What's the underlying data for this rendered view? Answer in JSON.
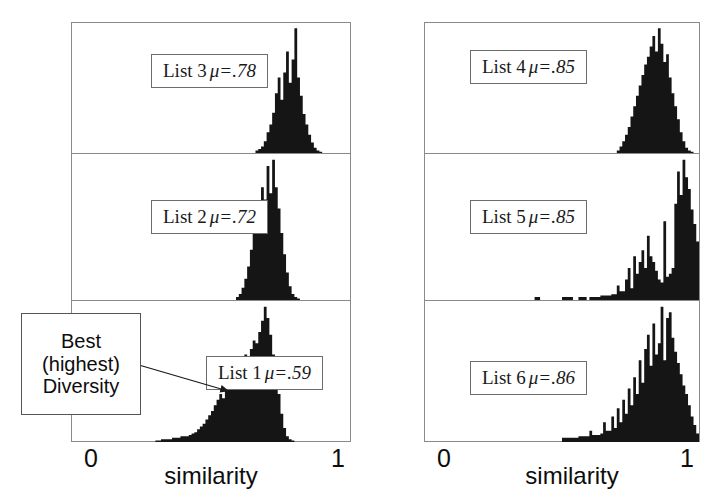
{
  "figure": {
    "title": "",
    "axis": {
      "xlabel": "similarity",
      "tick_min": "0",
      "tick_max": "1"
    },
    "callout": {
      "line1": "Best",
      "line2": "(highest)",
      "line3": "Diversity",
      "target": "List 1 histogram"
    },
    "panels": [
      {
        "id": "list3",
        "label_list": "List 3",
        "label_mu": "μ=.78"
      },
      {
        "id": "list2",
        "label_list": "List 2",
        "label_mu": "μ=.72"
      },
      {
        "id": "list1",
        "label_list": "List 1",
        "label_mu": "μ=.59"
      },
      {
        "id": "list4",
        "label_list": "List 4",
        "label_mu": "μ=.85"
      },
      {
        "id": "list5",
        "label_list": "List 5",
        "label_mu": "μ=.85"
      },
      {
        "id": "list6",
        "label_list": "List 6",
        "label_mu": "μ=.86"
      }
    ]
  },
  "chart_data": {
    "type": "bar",
    "xlabel": "similarity",
    "ylabel": "frequency",
    "xlim": [
      0,
      1
    ],
    "grid": false,
    "legend": "none",
    "layout": "2 columns x 3 stacked histogram panels",
    "bin_width": 0.01,
    "bin_centers": [
      0.005,
      0.015,
      0.025,
      0.035,
      0.045,
      0.055,
      0.065,
      0.075,
      0.085,
      0.095,
      0.105,
      0.115,
      0.125,
      0.135,
      0.145,
      0.155,
      0.165,
      0.175,
      0.185,
      0.195,
      0.205,
      0.215,
      0.225,
      0.235,
      0.245,
      0.255,
      0.265,
      0.275,
      0.285,
      0.295,
      0.305,
      0.315,
      0.325,
      0.335,
      0.345,
      0.355,
      0.365,
      0.375,
      0.385,
      0.395,
      0.405,
      0.415,
      0.425,
      0.435,
      0.445,
      0.455,
      0.465,
      0.475,
      0.485,
      0.495,
      0.505,
      0.515,
      0.525,
      0.535,
      0.545,
      0.555,
      0.565,
      0.575,
      0.585,
      0.595,
      0.605,
      0.615,
      0.625,
      0.635,
      0.645,
      0.655,
      0.665,
      0.675,
      0.685,
      0.695,
      0.705,
      0.715,
      0.725,
      0.735,
      0.745,
      0.755,
      0.765,
      0.775,
      0.785,
      0.795,
      0.805,
      0.815,
      0.825,
      0.835,
      0.845,
      0.855,
      0.865,
      0.875,
      0.885,
      0.895,
      0.905,
      0.915,
      0.925,
      0.935,
      0.945,
      0.955,
      0.965,
      0.975,
      0.985,
      0.995
    ],
    "panels": [
      {
        "name": "List 3",
        "mu": 0.78,
        "position": "left-column, top",
        "ymax": 100,
        "values": [
          0,
          0,
          0,
          0,
          0,
          0,
          0,
          0,
          0,
          0,
          0,
          0,
          0,
          0,
          0,
          0,
          0,
          0,
          0,
          0,
          0,
          0,
          0,
          0,
          0,
          0,
          0,
          0,
          0,
          0,
          0,
          0,
          0,
          0,
          0,
          0,
          0,
          0,
          0,
          0,
          0,
          0,
          0,
          0,
          0,
          0,
          0,
          0,
          0,
          0,
          0,
          0,
          0,
          0,
          0,
          0,
          0,
          0,
          0,
          0,
          0,
          0,
          0,
          0,
          0,
          0,
          2,
          3,
          5,
          9,
          16,
          22,
          31,
          46,
          58,
          41,
          62,
          78,
          54,
          72,
          96,
          58,
          44,
          30,
          22,
          14,
          8,
          4,
          2,
          1,
          0,
          0,
          0,
          0,
          0,
          0,
          0,
          0,
          0,
          0
        ]
      },
      {
        "name": "List 2",
        "mu": 0.72,
        "position": "left-column, middle",
        "ymax": 100,
        "values": [
          0,
          0,
          0,
          0,
          0,
          0,
          0,
          0,
          0,
          0,
          0,
          0,
          0,
          0,
          0,
          0,
          0,
          0,
          0,
          0,
          0,
          0,
          0,
          0,
          0,
          0,
          0,
          0,
          0,
          0,
          0,
          0,
          0,
          0,
          0,
          0,
          0,
          0,
          0,
          0,
          0,
          0,
          0,
          0,
          0,
          0,
          0,
          0,
          0,
          0,
          0,
          0,
          0,
          0,
          0,
          0,
          0,
          0,
          0,
          2,
          4,
          8,
          14,
          22,
          33,
          48,
          60,
          52,
          74,
          66,
          88,
          70,
          92,
          74,
          60,
          44,
          30,
          18,
          9,
          4,
          2,
          1,
          0,
          0,
          0,
          0,
          0,
          0,
          0,
          0,
          0,
          0,
          0,
          0,
          0,
          0,
          0,
          0,
          0,
          0
        ]
      },
      {
        "name": "List 1",
        "mu": 0.59,
        "position": "left-column, bottom",
        "ymax": 100,
        "values": [
          0,
          0,
          0,
          0,
          0,
          0,
          0,
          0,
          0,
          0,
          0,
          0,
          0,
          0,
          0,
          0,
          0,
          0,
          0,
          0,
          0,
          0,
          0,
          0,
          0,
          0,
          0,
          0,
          0,
          0,
          1,
          1,
          2,
          2,
          2,
          2,
          3,
          3,
          3,
          4,
          4,
          4,
          5,
          6,
          7,
          9,
          11,
          13,
          16,
          19,
          22,
          26,
          30,
          34,
          31,
          38,
          42,
          40,
          46,
          50,
          47,
          55,
          62,
          58,
          66,
          72,
          70,
          78,
          86,
          96,
          88,
          76,
          62,
          48,
          34,
          20,
          10,
          4,
          2,
          1,
          0,
          0,
          0,
          0,
          0,
          0,
          0,
          0,
          0,
          0,
          0,
          0,
          0,
          0,
          0,
          0,
          0,
          0,
          0,
          0
        ]
      },
      {
        "name": "List 4",
        "mu": 0.85,
        "position": "right-column, top",
        "ymax": 100,
        "values": [
          0,
          0,
          0,
          0,
          0,
          0,
          0,
          0,
          0,
          0,
          0,
          0,
          0,
          0,
          0,
          0,
          0,
          0,
          0,
          0,
          0,
          0,
          0,
          0,
          0,
          0,
          0,
          0,
          0,
          0,
          0,
          0,
          0,
          0,
          0,
          0,
          0,
          0,
          0,
          0,
          0,
          0,
          0,
          0,
          0,
          0,
          0,
          0,
          0,
          0,
          0,
          0,
          0,
          0,
          0,
          0,
          0,
          0,
          0,
          0,
          0,
          0,
          0,
          0,
          0,
          0,
          0,
          0,
          0,
          0,
          2,
          5,
          9,
          14,
          20,
          28,
          36,
          44,
          52,
          60,
          68,
          74,
          82,
          90,
          78,
          96,
          84,
          70,
          76,
          58,
          46,
          36,
          26,
          16,
          9,
          4,
          2,
          1,
          0,
          0
        ]
      },
      {
        "name": "List 5",
        "mu": 0.85,
        "position": "right-column, middle",
        "ymax": 100,
        "values": [
          0,
          0,
          0,
          0,
          0,
          0,
          0,
          0,
          0,
          0,
          0,
          0,
          0,
          0,
          0,
          0,
          0,
          0,
          0,
          0,
          0,
          0,
          0,
          0,
          0,
          0,
          0,
          0,
          0,
          0,
          0,
          0,
          0,
          0,
          0,
          0,
          0,
          0,
          0,
          0,
          2,
          2,
          0,
          0,
          0,
          0,
          0,
          0,
          0,
          0,
          2,
          2,
          2,
          2,
          0,
          0,
          2,
          2,
          2,
          0,
          2,
          2,
          2,
          2,
          3,
          3,
          3,
          3,
          4,
          4,
          10,
          6,
          6,
          14,
          22,
          8,
          30,
          18,
          26,
          34,
          22,
          44,
          30,
          26,
          20,
          14,
          12,
          54,
          16,
          18,
          22,
          66,
          88,
          72,
          96,
          84,
          76,
          62,
          52,
          40
        ]
      },
      {
        "name": "List 6",
        "mu": 0.86,
        "position": "right-column, bottom",
        "ymax": 100,
        "values": [
          0,
          0,
          0,
          0,
          0,
          0,
          0,
          0,
          0,
          0,
          0,
          0,
          0,
          0,
          0,
          0,
          0,
          0,
          0,
          0,
          0,
          0,
          0,
          0,
          0,
          0,
          0,
          0,
          0,
          0,
          0,
          0,
          0,
          0,
          0,
          0,
          0,
          0,
          0,
          0,
          0,
          0,
          0,
          0,
          0,
          0,
          0,
          0,
          0,
          0,
          3,
          3,
          3,
          3,
          3,
          3,
          4,
          4,
          4,
          4,
          8,
          5,
          5,
          5,
          6,
          14,
          8,
          8,
          18,
          10,
          24,
          14,
          30,
          20,
          38,
          26,
          46,
          34,
          58,
          42,
          66,
          76,
          54,
          84,
          62,
          70,
          96,
          58,
          88,
          92,
          74,
          64,
          56,
          48,
          40,
          34,
          26,
          18,
          12,
          6
        ]
      }
    ]
  }
}
